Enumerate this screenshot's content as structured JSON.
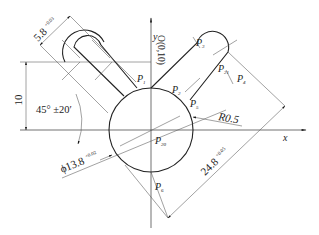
{
  "figure": {
    "type": "engineering-drawing",
    "axes": {
      "x_label": "x",
      "y_label": "y"
    },
    "origin_label": "O(0,10)",
    "points": {
      "P1": "P1",
      "P2": "P2",
      "P3": "P3",
      "P4": "P4",
      "P5": "P5",
      "P6": "P6",
      "P20": "P20",
      "P21": "P21"
    },
    "point_labels": [
      {
        "id": "P1",
        "main": "P",
        "sub": "1"
      },
      {
        "id": "P2",
        "main": "P",
        "sub": "2"
      },
      {
        "id": "P3",
        "main": "P",
        "sub": "3"
      },
      {
        "id": "P4",
        "main": "P",
        "sub": "4"
      },
      {
        "id": "P5",
        "main": "P",
        "sub": "5"
      },
      {
        "id": "P6",
        "main": "P",
        "sub": "6"
      },
      {
        "id": "P20",
        "main": "P",
        "sub": "20"
      },
      {
        "id": "P21",
        "main": "P",
        "sub": "21"
      }
    ],
    "dimensions": {
      "slot_width": {
        "value": "5.8",
        "upper": "+0.03",
        "lower": "0"
      },
      "offset_height": {
        "value": "10"
      },
      "angle": {
        "value": "45° ±20′"
      },
      "diameter": {
        "symbol": "ϕ",
        "value": "13.8",
        "upper": "+0.02",
        "lower": "0"
      },
      "radius": {
        "value": "R0.5"
      },
      "length": {
        "value": "24.8",
        "upper": "+0.05",
        "lower": "0"
      }
    }
  }
}
